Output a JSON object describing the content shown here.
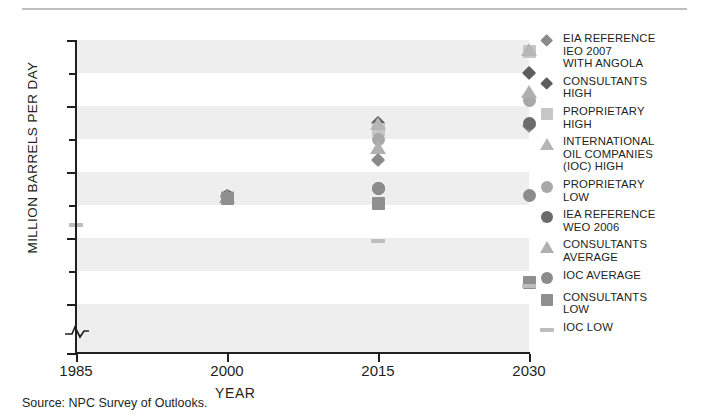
{
  "figure": {
    "source_note": "Source:  NPC Survey of Outlooks."
  },
  "chart_data": {
    "type": "scatter",
    "title": "",
    "xlabel": "YEAR",
    "ylabel": "MILLION BARRELS PER DAY",
    "xlim": [
      1985,
      2030
    ],
    "ylim": [
      0,
      70
    ],
    "y_axis_break": true,
    "y_break_between": [
      0,
      27.5
    ],
    "grid": "horizontal-bands",
    "band_step": 5,
    "x_ticks": [
      "1985",
      "2000",
      "2015",
      "2030"
    ],
    "y_ticks_major": [
      "70",
      "60",
      "50",
      "40",
      "30",
      "0"
    ],
    "y_ticks_minor": [
      65,
      55,
      45,
      35
    ],
    "legend_position": "right",
    "series": [
      {
        "name": "EIA REFERENCE\nIEO 2007\nWITH ANGOLA",
        "marker": "diamond",
        "color": "#8a8a8a",
        "points": [
          {
            "x": 2000,
            "y": 46.2
          },
          {
            "x": 2015,
            "y": 51.8
          },
          {
            "x": 2030,
            "y": 57.0
          }
        ]
      },
      {
        "name": "CONSULTANTS\nHIGH",
        "marker": "diamond",
        "color": "#5d5d5d",
        "points": [
          {
            "x": 2000,
            "y": 46.4
          },
          {
            "x": 2015,
            "y": 57.5
          },
          {
            "x": 2030,
            "y": 65.0
          }
        ]
      },
      {
        "name": "PROPRIETARY\nHIGH",
        "marker": "square",
        "color": "#c6c6c6",
        "points": [
          {
            "x": 2000,
            "y": 46.2
          },
          {
            "x": 2015,
            "y": 56.5
          },
          {
            "x": 2030,
            "y": 68.2
          }
        ]
      },
      {
        "name": "INTERNATIONAL\nOIL COMPANIES\n(IOC) HIGH",
        "marker": "triangle",
        "color": "#b6b6b6",
        "points": [
          {
            "x": 2000,
            "y": 46.3
          },
          {
            "x": 2015,
            "y": 57.3
          },
          {
            "x": 2030,
            "y": 68.4
          }
        ]
      },
      {
        "name": "PROPRIETARY\nLOW",
        "marker": "circle",
        "color": "#a8a8a8",
        "points": [
          {
            "x": 2000,
            "y": 46.1
          },
          {
            "x": 2015,
            "y": 55.0
          },
          {
            "x": 2030,
            "y": 60.8
          }
        ]
      },
      {
        "name": "IEA REFERENCE\nWEO 2006",
        "marker": "circle",
        "color": "#6b6b6b",
        "points": [
          {
            "x": 2000,
            "y": 46.3
          },
          {
            "x": 2015,
            "y": 47.5
          },
          {
            "x": 2030,
            "y": 57.4
          }
        ]
      },
      {
        "name": "CONSULTANTS\nAVERAGE",
        "marker": "triangle",
        "color": "#b0b0b0",
        "points": [
          {
            "x": 2000,
            "y": 46.2
          },
          {
            "x": 2015,
            "y": 53.6
          },
          {
            "x": 2030,
            "y": 62.1
          }
        ]
      },
      {
        "name": "IOC AVERAGE",
        "marker": "circle",
        "color": "#8c8c8c",
        "points": [
          {
            "x": 2000,
            "y": 46.0
          },
          {
            "x": 2015,
            "y": 47.6
          },
          {
            "x": 2030,
            "y": 46.5
          }
        ]
      },
      {
        "name": "CONSULTANTS\nLOW",
        "marker": "square",
        "color": "#8f8f8f",
        "points": [
          {
            "x": 2000,
            "y": 46.0
          },
          {
            "x": 2015,
            "y": 45.2
          },
          {
            "x": 2030,
            "y": 33.3
          }
        ]
      },
      {
        "name": "IOC LOW",
        "marker": "dash",
        "color": "#bdbdbd",
        "points": [
          {
            "x": 1985,
            "y": 42.0
          },
          {
            "x": 2015,
            "y": 39.6
          },
          {
            "x": 2030,
            "y": 32.8
          }
        ]
      }
    ]
  },
  "legend": {
    "items": [
      {
        "label": "EIA REFERENCE\nIEO 2007\nWITH ANGOLA",
        "marker": "diamond",
        "color": "#8a8a8a",
        "name": "legend-item-eia-reference-ieo-2007"
      },
      {
        "label": "CONSULTANTS\nHIGH",
        "marker": "diamond",
        "color": "#5d5d5d",
        "name": "legend-item-consultants-high"
      },
      {
        "label": "PROPRIETARY\nHIGH",
        "marker": "square",
        "color": "#c6c6c6",
        "name": "legend-item-proprietary-high"
      },
      {
        "label": "INTERNATIONAL\nOIL COMPANIES\n(IOC) HIGH",
        "marker": "triangle",
        "color": "#b6b6b6",
        "name": "legend-item-ioc-high"
      },
      {
        "label": "PROPRIETARY\nLOW",
        "marker": "circle",
        "color": "#a8a8a8",
        "name": "legend-item-proprietary-low"
      },
      {
        "label": "IEA REFERENCE\nWEO 2006",
        "marker": "circle",
        "color": "#6b6b6b",
        "name": "legend-item-iea-reference-weo-2006"
      },
      {
        "label": "CONSULTANTS\nAVERAGE",
        "marker": "triangle",
        "color": "#b0b0b0",
        "name": "legend-item-consultants-average"
      },
      {
        "label": "IOC AVERAGE",
        "marker": "circle",
        "color": "#8c8c8c",
        "name": "legend-item-ioc-average"
      },
      {
        "label": "CONSULTANTS\nLOW",
        "marker": "square",
        "color": "#8f8f8f",
        "name": "legend-item-consultants-low"
      },
      {
        "label": "IOC LOW",
        "marker": "dash",
        "color": "#bdbdbd",
        "name": "legend-item-ioc-low"
      }
    ]
  },
  "style": {
    "band_color": "#eeeeee",
    "axis_color": "#231f20",
    "background": "#ffffff",
    "rule_color": "#bfbfbf"
  }
}
